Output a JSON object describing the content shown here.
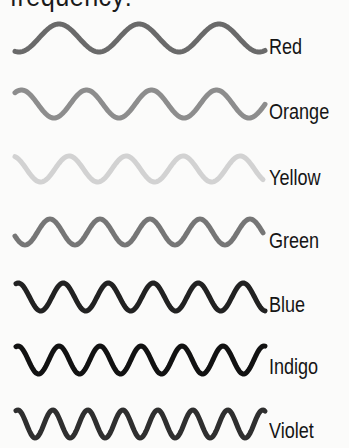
{
  "heading": "frequency:",
  "diagram": {
    "waves": [
      {
        "label": "Red",
        "color": "#6a6a6a",
        "peaks": 3,
        "period": 80,
        "x_start": 15,
        "x_end": 265,
        "y_center": 38,
        "amplitude": 14,
        "phase": -0.55,
        "label_top": 35
      },
      {
        "label": "Orange",
        "color": "#8d8d8d",
        "peaks": 4,
        "period": 65,
        "x_start": 15,
        "x_end": 265,
        "y_center": 104,
        "amplitude": 14,
        "phase": -0.1,
        "label_top": 100
      },
      {
        "label": "Yellow",
        "color": "#d2d2d2",
        "peaks": 4,
        "period": 57,
        "x_start": 15,
        "x_end": 263,
        "y_center": 169,
        "amplitude": 13,
        "phase": -0.95,
        "label_top": 166
      },
      {
        "label": "Green",
        "color": "#767676",
        "peaks": 5,
        "period": 50,
        "x_start": 15,
        "x_end": 263,
        "y_center": 232,
        "amplitude": 13,
        "phase": -0.7,
        "label_top": 229
      },
      {
        "label": "Blue",
        "color": "#222222",
        "peaks": 6,
        "period": 45,
        "x_start": 16,
        "x_end": 265,
        "y_center": 297,
        "amplitude": 14,
        "phase": -0.05,
        "label_top": 293
      },
      {
        "label": "Indigo",
        "color": "#121212",
        "peaks": 6,
        "period": 41,
        "x_start": 16,
        "x_end": 265,
        "y_center": 360,
        "amplitude": 14,
        "phase": -0.05,
        "label_top": 355
      },
      {
        "label": "Violet",
        "color": "#2f2f2f",
        "peaks": 7,
        "period": 35,
        "x_start": 16,
        "x_end": 265,
        "y_center": 424,
        "amplitude": 14,
        "phase": -0.05,
        "label_top": 419
      }
    ]
  }
}
